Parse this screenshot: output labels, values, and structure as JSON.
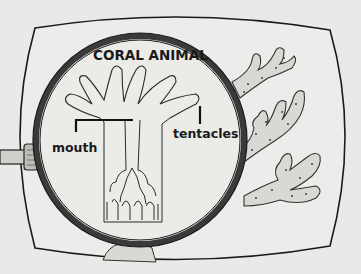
{
  "diagram": {
    "title": "CORAL ANIMAL",
    "labels": {
      "mouth": "mouth",
      "tentacles": "tentacles"
    },
    "elements": [
      "rounded-frame",
      "magnifying-glass",
      "coral-polyp-cross-section",
      "coral-branches"
    ],
    "colors": {
      "background": "#e9e9e7",
      "ink": "#1a1a1a",
      "coral_fill": "#dcdcd8"
    }
  }
}
